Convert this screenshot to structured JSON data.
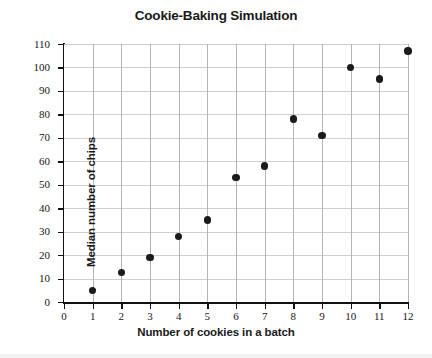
{
  "chart_data": {
    "type": "scatter",
    "title": "Cookie-Baking Simulation",
    "xlabel": "Number of cookies in a batch",
    "ylabel": "Median number of chips",
    "xlim": [
      0,
      12
    ],
    "ylim": [
      0,
      110
    ],
    "xticks": [
      0,
      1,
      2,
      3,
      4,
      5,
      6,
      7,
      8,
      9,
      10,
      11,
      12
    ],
    "yticks": [
      0,
      10,
      20,
      30,
      40,
      50,
      60,
      70,
      80,
      90,
      100,
      110
    ],
    "grid": true,
    "legend": false,
    "legend_position": "none",
    "marker": "filled-circle",
    "marker_color": "#1b1b1b",
    "grid_color": "#cfcfcf",
    "axis_color": "#111111",
    "background_color": "#ffffff",
    "x": [
      1,
      2,
      3,
      4,
      5,
      6,
      7,
      8,
      9,
      10,
      11,
      12
    ],
    "values": [
      5,
      12.5,
      19,
      28,
      35,
      53,
      58,
      78,
      71,
      100,
      95,
      107
    ],
    "points": [
      {
        "x": 1,
        "y": 5
      },
      {
        "x": 2,
        "y": 12.5
      },
      {
        "x": 3,
        "y": 19
      },
      {
        "x": 4,
        "y": 28
      },
      {
        "x": 5,
        "y": 35
      },
      {
        "x": 6,
        "y": 53
      },
      {
        "x": 7,
        "y": 58
      },
      {
        "x": 8,
        "y": 78
      },
      {
        "x": 9,
        "y": 71
      },
      {
        "x": 10,
        "y": 100
      },
      {
        "x": 11,
        "y": 95
      },
      {
        "x": 12,
        "y": 107
      }
    ]
  }
}
